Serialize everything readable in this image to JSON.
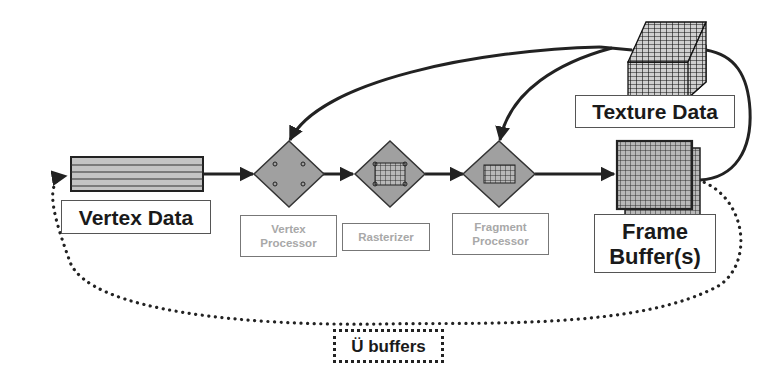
{
  "diagram": {
    "type": "graphics-pipeline",
    "nodes": {
      "vertex_data": {
        "label": "Vertex Data"
      },
      "vertex_processor": {
        "label_line1": "Vertex",
        "label_line2": "Processor"
      },
      "rasterizer": {
        "label": "Rasterizer"
      },
      "fragment_processor": {
        "label_line1": "Fragment",
        "label_line2": "Processor"
      },
      "frame_buffer": {
        "label_line1": "Frame",
        "label_line2": "Buffer(s)"
      },
      "texture_data": {
        "label": "Texture Data"
      },
      "buffers": {
        "label": "Ü buffers"
      }
    },
    "edges": [
      {
        "from": "vertex_data",
        "to": "vertex_processor",
        "style": "solid"
      },
      {
        "from": "vertex_processor",
        "to": "rasterizer",
        "style": "solid"
      },
      {
        "from": "rasterizer",
        "to": "fragment_processor",
        "style": "solid"
      },
      {
        "from": "fragment_processor",
        "to": "frame_buffer",
        "style": "solid"
      },
      {
        "from": "texture_data",
        "to": "vertex_processor",
        "style": "solid-curve"
      },
      {
        "from": "texture_data",
        "to": "fragment_processor",
        "style": "solid-curve"
      },
      {
        "from": "frame_buffer",
        "to": "texture_data",
        "style": "solid-curve"
      },
      {
        "from": "frame_buffer",
        "to": "vertex_data",
        "style": "dotted-loop",
        "via": "buffers"
      }
    ],
    "colors": {
      "stroke": "#222222",
      "fill_gray": "#a0a0a0",
      "light_label": "#a8a8a8"
    }
  }
}
